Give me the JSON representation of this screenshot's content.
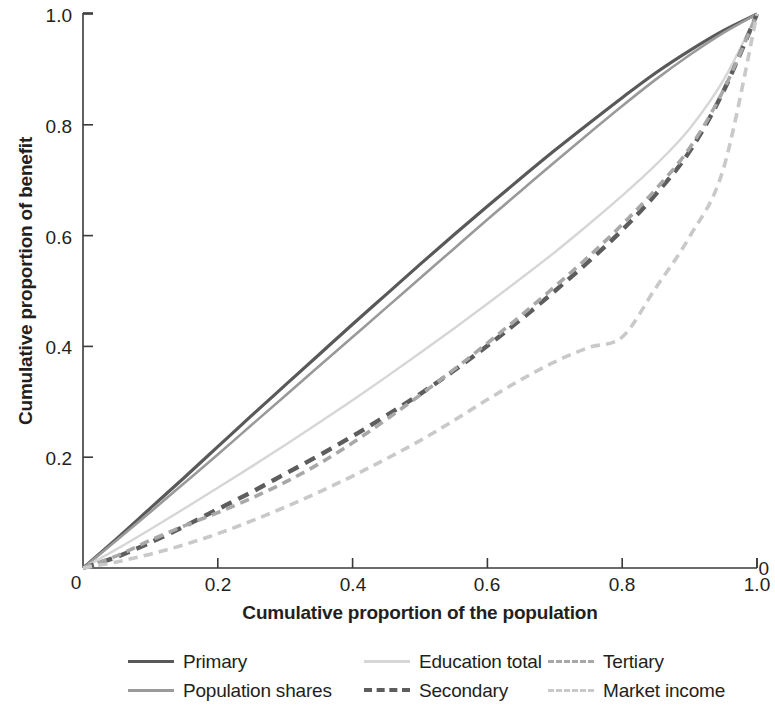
{
  "axes": {
    "xlabel": "Cumulative proportion of the population",
    "ylabel": "Cumulative proportion of benefit",
    "xticks": [
      "0",
      "0.2",
      "0.4",
      "0.6",
      "0.8",
      "1.0"
    ],
    "yticks": [
      "0",
      "0.2",
      "0.4",
      "0.6",
      "0.8",
      "1.0"
    ]
  },
  "legend": {
    "items": [
      {
        "label": "Primary",
        "color": "#595959",
        "style": "solid",
        "width": 3.2
      },
      {
        "label": "Population shares",
        "color": "#9a9a9a",
        "style": "solid",
        "width": 2.6
      },
      {
        "label": "Education total",
        "color": "#d6d6d6",
        "style": "solid",
        "width": 2.4
      },
      {
        "label": "Secondary",
        "color": "#5d5d5d",
        "style": "dashed",
        "width": 4.4
      },
      {
        "label": "Tertiary",
        "color": "#a8a8a8",
        "style": "dashed",
        "width": 3.6
      },
      {
        "label": "Market income",
        "color": "#c9c9c9",
        "style": "dashed",
        "width": 3.6
      }
    ]
  },
  "chart_data": {
    "type": "line",
    "title": "",
    "xlabel": "Cumulative proportion of the population",
    "ylabel": "Cumulative proportion of benefit",
    "xlim": [
      0,
      1.0
    ],
    "ylim": [
      0,
      1.0
    ],
    "xticks": [
      0,
      0.2,
      0.4,
      0.6,
      0.8,
      1.0
    ],
    "yticks": [
      0,
      0.2,
      0.4,
      0.6,
      0.8,
      1.0
    ],
    "grid": false,
    "legend_position": "below-axes",
    "x": [
      0,
      0.05,
      0.1,
      0.15,
      0.2,
      0.25,
      0.3,
      0.35,
      0.4,
      0.45,
      0.5,
      0.55,
      0.6,
      0.65,
      0.7,
      0.75,
      0.8,
      0.85,
      0.9,
      0.95,
      1.0
    ],
    "series": [
      {
        "name": "Primary",
        "color": "#595959",
        "style": "solid",
        "values": [
          0,
          0.053,
          0.108,
          0.163,
          0.219,
          0.275,
          0.33,
          0.385,
          0.44,
          0.494,
          0.548,
          0.601,
          0.653,
          0.704,
          0.754,
          0.802,
          0.849,
          0.894,
          0.934,
          0.97,
          1.0
        ]
      },
      {
        "name": "Population shares",
        "color": "#9a9a9a",
        "style": "solid",
        "values": [
          0,
          0.05,
          0.101,
          0.153,
          0.205,
          0.258,
          0.311,
          0.364,
          0.417,
          0.47,
          0.523,
          0.576,
          0.629,
          0.681,
          0.733,
          0.784,
          0.834,
          0.882,
          0.926,
          0.966,
          1.0
        ]
      },
      {
        "name": "Education total",
        "color": "#d6d6d6",
        "style": "solid",
        "values": [
          0,
          0.034,
          0.07,
          0.107,
          0.145,
          0.183,
          0.222,
          0.262,
          0.303,
          0.345,
          0.388,
          0.432,
          0.477,
          0.523,
          0.57,
          0.62,
          0.672,
          0.728,
          0.793,
          0.88,
          1.0
        ]
      },
      {
        "name": "Secondary",
        "color": "#5d5d5d",
        "style": "dashed",
        "values": [
          0,
          0.02,
          0.046,
          0.075,
          0.106,
          0.137,
          0.17,
          0.203,
          0.238,
          0.275,
          0.314,
          0.356,
          0.401,
          0.449,
          0.5,
          0.553,
          0.61,
          0.675,
          0.752,
          0.86,
          1.0
        ]
      },
      {
        "name": "Tertiary",
        "color": "#a8a8a8",
        "style": "dashed",
        "values": [
          0,
          0.022,
          0.05,
          0.076,
          0.1,
          0.126,
          0.155,
          0.188,
          0.226,
          0.268,
          0.312,
          0.358,
          0.406,
          0.456,
          0.508,
          0.562,
          0.62,
          0.684,
          0.758,
          0.862,
          1.0
        ]
      },
      {
        "name": "Market income",
        "color": "#c9c9c9",
        "style": "dashed",
        "values": [
          0,
          0.011,
          0.025,
          0.042,
          0.062,
          0.085,
          0.11,
          0.137,
          0.166,
          0.197,
          0.23,
          0.266,
          0.304,
          0.34,
          0.372,
          0.398,
          0.417,
          0.506,
          0.598,
          0.72,
          1.0
        ]
      }
    ],
    "annotations": [
      {
        "text": "Market income curve shows a pronounced kink near x = 0.80, y = 0.415"
      }
    ]
  }
}
